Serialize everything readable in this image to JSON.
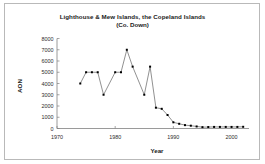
{
  "chart_data": {
    "type": "line",
    "title": "Lighthouse & Mew Islands, the Copeland Islands",
    "subtitle": "(Co. Down)",
    "xlabel": "Year",
    "ylabel": "AON",
    "xlim": [
      1970,
      2003
    ],
    "ylim": [
      0,
      8000
    ],
    "xticks": [
      1970,
      1980,
      1990,
      2000
    ],
    "xtick_labels": [
      "1970",
      "1980",
      "1990",
      "2000"
    ],
    "yticks": [
      0,
      1000,
      2000,
      3000,
      4000,
      5000,
      6000,
      7000,
      8000
    ],
    "ytick_labels": [
      "0",
      "1000",
      "2000",
      "3000",
      "4000",
      "5000",
      "6000",
      "7000",
      "8000"
    ],
    "grid": false,
    "legend": false,
    "marker": "square",
    "series": [
      {
        "name": "AON",
        "x": [
          1974,
          1975,
          1976,
          1977,
          1978,
          1980,
          1981,
          1982,
          1983,
          1985,
          1986,
          1987,
          1988,
          1989,
          1990,
          1991,
          1992,
          1993,
          1994,
          1995,
          1996,
          1997,
          1998,
          1999,
          2000,
          2001,
          2002
        ],
        "values": [
          4000,
          5000,
          5000,
          5000,
          3000,
          5000,
          5000,
          7000,
          5500,
          3000,
          5500,
          1850,
          1750,
          1200,
          550,
          420,
          300,
          250,
          180,
          120,
          130,
          140,
          140,
          140,
          140,
          140,
          150
        ]
      }
    ]
  },
  "axis": {
    "ylabel": "AON",
    "xlabel": "Year"
  }
}
